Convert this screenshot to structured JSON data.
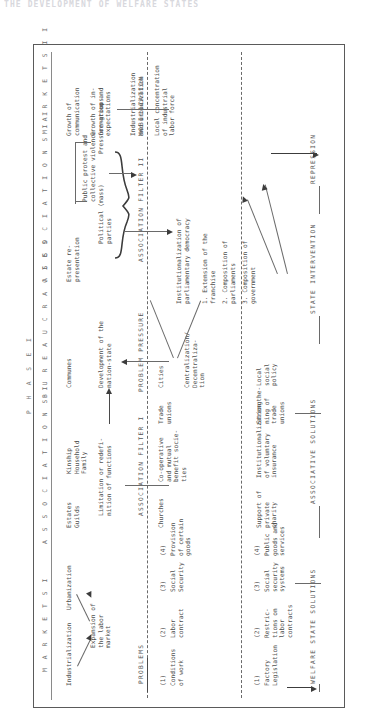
{
  "running_head": "THE DEVELOPMENT OF WELFARE STATES",
  "figure": {
    "phase_headers": [
      {
        "id": "phase-1",
        "label": "P H A S E   I"
      }
    ],
    "column_headers": [
      {
        "id": "markets-1",
        "label": "M A R K E T S   I"
      },
      {
        "id": "associations-1",
        "label": "A S S O C I A T I O N S   I"
      },
      {
        "id": "bureaucracies",
        "label": "B U R E A U C R A C I E S"
      },
      {
        "id": "associations-2",
        "label": "A S S O C I A T I O N S   I I"
      },
      {
        "id": "markets-2",
        "label": "M A R K E T S   I I"
      }
    ],
    "band_labels": [
      {
        "id": "problems",
        "label": "PROBLEMS"
      },
      {
        "id": "association-filter-1",
        "label": "ASSOCIATION FILTER I"
      },
      {
        "id": "problem-pressure",
        "label": "PROBLEM PRESSURE"
      },
      {
        "id": "association-filter-2",
        "label": "ASSOCIATION FILTER II"
      },
      {
        "id": "mobilization",
        "label": "MOBILIZATION"
      },
      {
        "id": "welfare-state-solutions",
        "label": "WELFARE STATE SOLUTIONS"
      },
      {
        "id": "associative-solutions",
        "label": "ASSOCIATIVE SOLUTIONS"
      },
      {
        "id": "state-intervention",
        "label": "STATE INTERVENTION"
      },
      {
        "id": "repression",
        "label": "REPRESSION"
      }
    ],
    "markets_1": {
      "industrialization": "Industrialization",
      "urbanization": "Urbanization",
      "expansion": "Expansion of\nthe labor\nmarket"
    },
    "associations_1": {
      "estates_guilds": "Estates\nGuilds",
      "kinship": "Kinship\nHousehold\nFamily",
      "limitation": "Limitation or redefi-\nnition of functions",
      "churches": "Churches",
      "cooperative": "Co-operative\nand mutual\nbenefit socie-\nties",
      "trade_unions": "Trade\nunions"
    },
    "bureaucracies": {
      "communes": "Communes",
      "development": "Development of the\nnation-state",
      "cities": "Cities",
      "centralization": "Centralization/\nDecentraliza-\ntion",
      "institutionalization": "Institutionalization of\nparliamentary democracy",
      "item_1": "1. Extension of the\n   franchise",
      "item_2": "2. Composition of\n   parliaments",
      "item_3": "3. Composition of\n   government"
    },
    "associations_2": {
      "estate_representation": "Estate re-\npresentation",
      "political_parties": "Political (mass)\nparties",
      "pressure_groups": "Pressure-groups",
      "public_protest": "Public protest and\ncollective violence"
    },
    "markets_2": {
      "industrialization_urbanization": "Industrialization\nand urbanization",
      "local_concentration": "Local concentration\nof industrial\nlabor force",
      "growth_communication": "Growth of\ncommunication",
      "growth_information": "Growth of in-\nformation and\nexpectations"
    },
    "problems": [
      {
        "num": "(1)",
        "text": "Conditions\nof work"
      },
      {
        "num": "(2)",
        "text": "Labor\ncontract"
      },
      {
        "num": "(3)",
        "text": "Social\nSecurity"
      },
      {
        "num": "(4)",
        "text": "Provision\nof certain\ngoods"
      }
    ],
    "welfare_state_solutions": [
      {
        "num": "(1)",
        "text": "Factory\nLegislation"
      },
      {
        "num": "(2)",
        "text": "Restric-\ntions on\nlabor\ncontracts"
      },
      {
        "num": "(3)",
        "text": "Social\nsecurity\nsystems"
      },
      {
        "num": "(4)",
        "text": "Public\ngoods and\nservices"
      }
    ],
    "associative_solutions": [
      {
        "text": "Support of\nprivate\ncharity"
      },
      {
        "text": "Institutionalization\nof voluntary\ninsurance"
      },
      {
        "text": "Strengthe-\nning of\ntrade\nunions"
      },
      {
        "text": "Local\nsocial\npolicy"
      }
    ]
  }
}
